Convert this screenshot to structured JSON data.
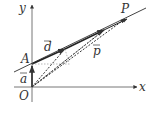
{
  "diagram": {
    "axes": {
      "x_label": "x",
      "y_label": "y",
      "origin_label": "O"
    },
    "points": {
      "A": "A",
      "P": "P"
    },
    "vectors": {
      "a": "a",
      "d": "d",
      "p": "p"
    },
    "colors": {
      "stroke": "#333333",
      "background": "#ffffff"
    }
  }
}
